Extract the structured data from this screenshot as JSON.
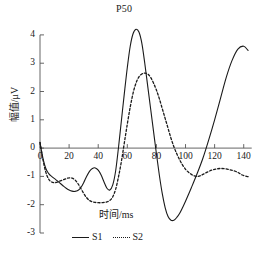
{
  "chart_data": {
    "type": "line",
    "title": "",
    "xlabel": "时间/ms",
    "ylabel": "幅值/μV",
    "xlim": [
      0,
      145
    ],
    "ylim": [
      -3,
      4.35
    ],
    "grid": false,
    "legend_position": "bottom-center",
    "xticks": [
      0,
      20,
      40,
      60,
      80,
      100,
      120,
      140
    ],
    "xtick_labels": [
      "0",
      "20",
      "40",
      "60",
      "80",
      "100",
      "120",
      "140"
    ],
    "yticks": [
      4,
      3,
      2,
      1,
      0,
      -1,
      -2,
      -3
    ],
    "ytick_labels": [
      "4",
      "3",
      "2",
      "1",
      "0",
      "-1",
      "-2",
      "-3"
    ],
    "annotations": [
      {
        "text": "P50",
        "x": 65,
        "y": 4.2,
        "note": "label marks the S1 positive peak near 65 ms"
      }
    ],
    "series": [
      {
        "name": "S1",
        "style": "solid",
        "color": "#1a1a1a",
        "x": [
          0,
          2,
          4,
          6,
          8,
          10,
          12,
          14,
          16,
          18,
          20,
          22,
          24,
          26,
          28,
          30,
          32,
          34,
          36,
          38,
          40,
          42,
          44,
          46,
          48,
          50,
          52,
          54,
          56,
          58,
          60,
          62,
          64,
          66,
          68,
          70,
          72,
          74,
          76,
          78,
          80,
          82,
          84,
          86,
          88,
          90,
          92,
          94,
          96,
          98,
          100,
          104,
          108,
          112,
          116,
          120,
          124,
          128,
          132,
          136,
          140,
          143
        ],
        "y": [
          0.2,
          -0.35,
          -0.72,
          -0.9,
          -1.0,
          -1.08,
          -1.16,
          -1.25,
          -1.34,
          -1.42,
          -1.48,
          -1.52,
          -1.53,
          -1.5,
          -1.4,
          -1.22,
          -1.0,
          -0.82,
          -0.72,
          -0.7,
          -0.78,
          -0.95,
          -1.2,
          -1.42,
          -1.48,
          -1.3,
          -0.8,
          0.05,
          1.0,
          1.95,
          2.85,
          3.6,
          4.05,
          4.2,
          4.1,
          3.7,
          3.0,
          2.2,
          1.4,
          0.6,
          -0.2,
          -0.95,
          -1.6,
          -2.1,
          -2.42,
          -2.55,
          -2.55,
          -2.45,
          -2.3,
          -2.1,
          -1.88,
          -1.4,
          -0.9,
          -0.35,
          0.3,
          1.0,
          1.75,
          2.5,
          3.1,
          3.5,
          3.6,
          3.45
        ]
      },
      {
        "name": "S2",
        "style": "dotted",
        "color": "#1a1a1a",
        "x": [
          0,
          2,
          4,
          6,
          8,
          10,
          12,
          14,
          16,
          18,
          20,
          22,
          24,
          26,
          28,
          30,
          32,
          34,
          36,
          38,
          40,
          42,
          44,
          46,
          48,
          50,
          52,
          54,
          56,
          58,
          60,
          62,
          64,
          66,
          68,
          70,
          72,
          74,
          76,
          78,
          80,
          82,
          84,
          86,
          88,
          90,
          92,
          94,
          96,
          98,
          100,
          102,
          104,
          106,
          108,
          110,
          112,
          115,
          118,
          121,
          124,
          127,
          130,
          133,
          136,
          139,
          142,
          144
        ],
        "y": [
          0.2,
          -0.4,
          -0.85,
          -1.1,
          -1.2,
          -1.22,
          -1.2,
          -1.16,
          -1.12,
          -1.08,
          -1.05,
          -1.06,
          -1.12,
          -1.25,
          -1.42,
          -1.6,
          -1.75,
          -1.85,
          -1.9,
          -1.92,
          -1.93,
          -1.93,
          -1.92,
          -1.9,
          -1.85,
          -1.72,
          -1.45,
          -1.0,
          -0.45,
          0.2,
          0.85,
          1.45,
          1.95,
          2.3,
          2.52,
          2.62,
          2.65,
          2.62,
          2.5,
          2.3,
          2.05,
          1.75,
          1.4,
          1.05,
          0.7,
          0.35,
          0.05,
          -0.2,
          -0.42,
          -0.6,
          -0.75,
          -0.85,
          -0.93,
          -0.98,
          -1.0,
          -0.98,
          -0.93,
          -0.85,
          -0.78,
          -0.74,
          -0.72,
          -0.73,
          -0.76,
          -0.8,
          -0.86,
          -0.95,
          -1.0,
          -1.02
        ]
      }
    ]
  },
  "legend": {
    "items": [
      {
        "label": "S1",
        "style": "solid"
      },
      {
        "label": "S2",
        "style": "dotted"
      }
    ]
  }
}
